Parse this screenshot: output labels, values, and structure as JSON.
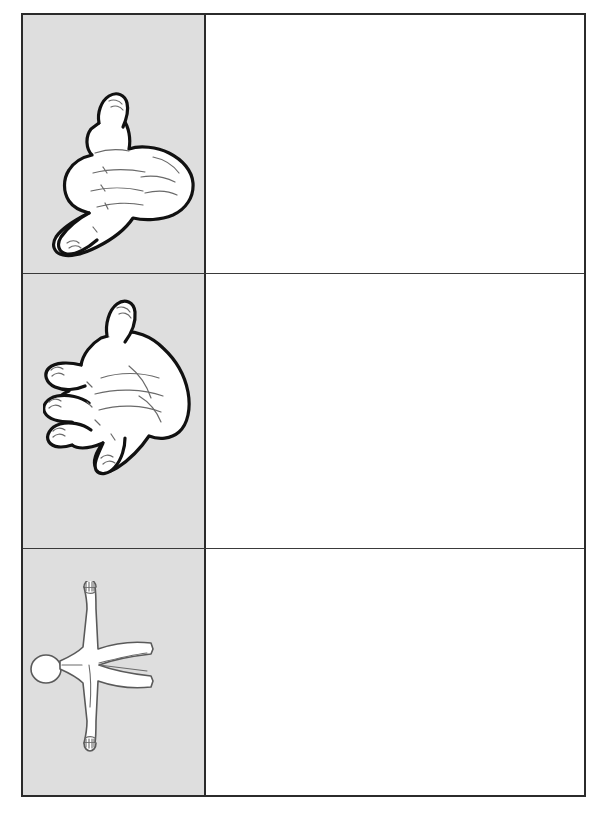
{
  "page": {
    "background_color": "#ffffff",
    "caption": ""
  },
  "worksheet": {
    "border_color": "#2b2b2b",
    "label_cell_background": "#dedede",
    "blank_cell_background": "#ffffff",
    "rows": [
      {
        "label": "Ones",
        "illustration": "asl-hand-ones-icon",
        "illustration_description": "hand with thumb and little finger extended",
        "answer_value": ""
      },
      {
        "label": "Fives",
        "illustration": "asl-hand-fives-icon",
        "illustration_description": "open hand with five fingers spread",
        "answer_value": ""
      },
      {
        "label": "Twenties",
        "illustration": "whole-body-twenties-icon",
        "illustration_description": "full human body figure with arms and legs outstretched",
        "answer_value": ""
      }
    ]
  }
}
